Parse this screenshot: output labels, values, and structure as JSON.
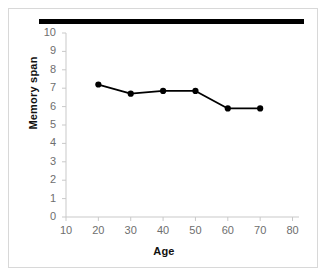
{
  "figure": {
    "panel_border_color": "#d8d8d8",
    "background_color": "#ffffff",
    "top_rule_color": "#000000"
  },
  "chart_data": {
    "type": "line",
    "title": "",
    "xlabel": "Age",
    "ylabel": "Memory span",
    "x": [
      20,
      30,
      40,
      50,
      60,
      70
    ],
    "values": [
      7.2,
      6.7,
      6.85,
      6.85,
      5.9,
      5.9
    ],
    "series": [
      {
        "name": "Memory span by age",
        "values": [
          7.2,
          6.7,
          6.85,
          6.85,
          5.9,
          5.9
        ],
        "color": "#000000",
        "marker": "circle"
      }
    ],
    "xlim": [
      10,
      82
    ],
    "ylim": [
      0,
      10
    ],
    "xticks": [
      10,
      20,
      30,
      40,
      50,
      60,
      70,
      80
    ],
    "yticks": [
      0,
      1,
      2,
      3,
      4,
      5,
      6,
      7,
      8,
      9,
      10
    ],
    "xtick_labels": [
      "10",
      "20",
      "30",
      "40",
      "50",
      "60",
      "70",
      "80"
    ],
    "ytick_labels": [
      "0",
      "1",
      "2",
      "3",
      "4",
      "5",
      "6",
      "7",
      "8",
      "9",
      "10"
    ],
    "grid": false,
    "legend": "none",
    "axis_color": "#c9c9c9",
    "tick_label_color": "#6e6e6e",
    "line_color": "#000000",
    "marker_color": "#000000"
  }
}
